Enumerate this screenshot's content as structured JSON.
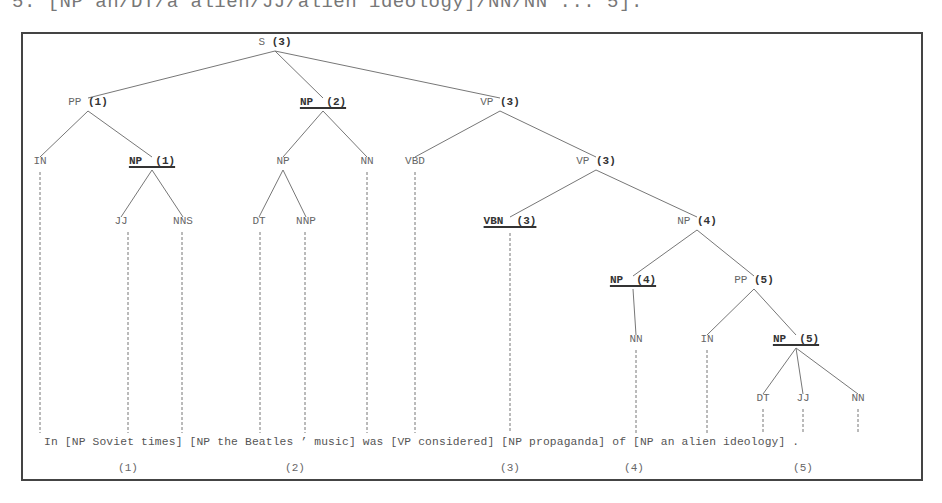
{
  "top_fragment": "5. [NP an/DT/a alien/JJ/alien ideology]/NN/NN ... 5].",
  "tree": {
    "nodes": [
      {
        "id": "S",
        "label": "S",
        "idx": "(3)",
        "x": 275,
        "y": 43,
        "head": false
      },
      {
        "id": "PP1",
        "label": "PP",
        "idx": "(1)",
        "x": 88,
        "y": 103,
        "head": false
      },
      {
        "id": "NP2",
        "label": "NP  (2)",
        "idx": "",
        "x": 323,
        "y": 103,
        "head": true
      },
      {
        "id": "VP3a",
        "label": "VP",
        "idx": "(3)",
        "x": 500,
        "y": 103,
        "head": false
      },
      {
        "id": "IN1",
        "label": "IN",
        "idx": "",
        "x": 40,
        "y": 162,
        "head": false
      },
      {
        "id": "NP1",
        "label": "NP  (1)",
        "idx": "",
        "x": 152,
        "y": 162,
        "head": true
      },
      {
        "id": "NPb",
        "label": "NP",
        "idx": "",
        "x": 283,
        "y": 162,
        "head": false
      },
      {
        "id": "NN1",
        "label": "NN",
        "idx": "",
        "x": 367,
        "y": 162,
        "head": false
      },
      {
        "id": "VBD",
        "label": "VBD",
        "idx": "",
        "x": 415,
        "y": 162,
        "head": false
      },
      {
        "id": "VP3b",
        "label": "VP",
        "idx": "(3)",
        "x": 596,
        "y": 162,
        "head": false
      },
      {
        "id": "JJ1",
        "label": "JJ",
        "idx": "",
        "x": 121,
        "y": 222,
        "head": false
      },
      {
        "id": "NNS",
        "label": "NNS",
        "idx": "",
        "x": 183,
        "y": 222,
        "head": false
      },
      {
        "id": "DT1",
        "label": "DT",
        "idx": "",
        "x": 259,
        "y": 222,
        "head": false
      },
      {
        "id": "NNP",
        "label": "NNP",
        "idx": "",
        "x": 306,
        "y": 222,
        "head": false
      },
      {
        "id": "VBN",
        "label": "VBN  (3)",
        "idx": "",
        "x": 510,
        "y": 222,
        "head": true
      },
      {
        "id": "NP4a",
        "label": "NP",
        "idx": "(4)",
        "x": 697,
        "y": 222,
        "head": false
      },
      {
        "id": "NP4b",
        "label": "NP  (4)",
        "idx": "",
        "x": 633,
        "y": 281,
        "head": true
      },
      {
        "id": "PP5",
        "label": "PP",
        "idx": "(5)",
        "x": 754,
        "y": 281,
        "head": false
      },
      {
        "id": "NN2",
        "label": "NN",
        "idx": "",
        "x": 636,
        "y": 340,
        "head": false
      },
      {
        "id": "IN2",
        "label": "IN",
        "idx": "",
        "x": 707,
        "y": 340,
        "head": false
      },
      {
        "id": "NP5",
        "label": "NP  (5)",
        "idx": "",
        "x": 796,
        "y": 340,
        "head": true
      },
      {
        "id": "DT2",
        "label": "DT",
        "idx": "",
        "x": 763,
        "y": 399,
        "head": false
      },
      {
        "id": "JJ2",
        "label": "JJ",
        "idx": "",
        "x": 803,
        "y": 399,
        "head": false
      },
      {
        "id": "NN3",
        "label": "NN",
        "idx": "",
        "x": 858,
        "y": 399,
        "head": false
      }
    ],
    "edges": [
      [
        "S",
        "PP1"
      ],
      [
        "S",
        "NP2"
      ],
      [
        "S",
        "VP3a"
      ],
      [
        "PP1",
        "IN1"
      ],
      [
        "PP1",
        "NP1"
      ],
      [
        "NP2",
        "NPb"
      ],
      [
        "NP2",
        "NN1"
      ],
      [
        "VP3a",
        "VBD"
      ],
      [
        "VP3a",
        "VP3b"
      ],
      [
        "NP1",
        "JJ1"
      ],
      [
        "NP1",
        "NNS"
      ],
      [
        "NPb",
        "DT1"
      ],
      [
        "NPb",
        "NNP"
      ],
      [
        "VP3b",
        "VBN"
      ],
      [
        "VP3b",
        "NP4a"
      ],
      [
        "NP4a",
        "NP4b"
      ],
      [
        "NP4a",
        "PP5"
      ],
      [
        "NP4b",
        "NN2"
      ],
      [
        "PP5",
        "IN2"
      ],
      [
        "PP5",
        "NP5"
      ],
      [
        "NP5",
        "DT2"
      ],
      [
        "NP5",
        "JJ2"
      ],
      [
        "NP5",
        "NN3"
      ]
    ],
    "leaf_links": [
      {
        "x": 40,
        "from": 172
      },
      {
        "x": 128,
        "from": 232
      },
      {
        "x": 182,
        "from": 232
      },
      {
        "x": 260,
        "from": 232
      },
      {
        "x": 305,
        "from": 232
      },
      {
        "x": 367,
        "from": 172
      },
      {
        "x": 415,
        "from": 172
      },
      {
        "x": 510,
        "from": 233
      },
      {
        "x": 636,
        "from": 350
      },
      {
        "x": 707,
        "from": 350
      },
      {
        "x": 763,
        "from": 409
      },
      {
        "x": 803,
        "from": 409
      },
      {
        "x": 858,
        "from": 409
      }
    ]
  },
  "sentence": "In [NP Soviet times] [NP the Beatles ’ music] was [VP considered] [NP propaganda] of [NP an alien ideology] .",
  "chunk_numbers": [
    {
      "label": "(1)",
      "x": 128
    },
    {
      "label": "(2)",
      "x": 295
    },
    {
      "label": "(3)",
      "x": 510
    },
    {
      "label": "(4)",
      "x": 634
    },
    {
      "label": "(5)",
      "x": 803
    }
  ],
  "colors": {
    "line": "#777777",
    "frame": "#444444",
    "head_text": "#333333"
  }
}
